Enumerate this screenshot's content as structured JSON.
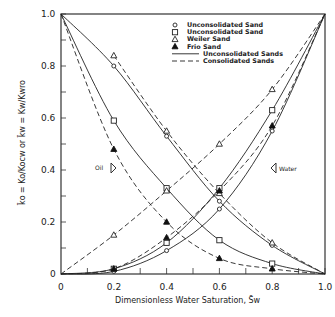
{
  "chart_data": {
    "type": "line",
    "title": "",
    "xlabel": "Dimensionless Water Saturation, S̄w",
    "ylabel": "k̄o = Ko/Kocw  or  k̄w = Kw/Kwro",
    "xlim": [
      0,
      1.0
    ],
    "ylim": [
      0,
      1.0
    ],
    "x_ticks": [
      "0",
      "0.2",
      "0.4",
      "0.6",
      "0.8",
      "1.0"
    ],
    "y_ticks": [
      "0",
      "0.2",
      "0.4",
      "0.6",
      "0.8",
      "1.0"
    ],
    "grid": false,
    "legend_position": "upper-right",
    "legend": [
      {
        "marker": "circle",
        "label": "Unconsolidated Sand"
      },
      {
        "marker": "square",
        "label": "Unconsolidated Sand"
      },
      {
        "marker": "triangle-open",
        "label": "Weiler Sand"
      },
      {
        "marker": "triangle-filled",
        "label": "Frio Sand"
      },
      {
        "line": "solid",
        "label": "Unconsolidated Sands"
      },
      {
        "line": "dashed",
        "label": "Consolidated Sands"
      }
    ],
    "annotations": [
      {
        "text": "Oil",
        "x": 0.19,
        "y": 0.41
      },
      {
        "text": "Water",
        "x": 0.84,
        "y": 0.41
      }
    ],
    "series": [
      {
        "name": "Oil - Unconsolidated Sand (circle)",
        "style": "solid",
        "marker": "circle",
        "x": [
          0,
          0.2,
          0.4,
          0.6,
          0.8,
          1.0
        ],
        "y": [
          1.0,
          0.8,
          0.53,
          0.28,
          0.11,
          0
        ]
      },
      {
        "name": "Oil - Unconsolidated Sand (square)",
        "style": "solid",
        "marker": "square",
        "x": [
          0,
          0.2,
          0.4,
          0.6,
          0.8,
          1.0
        ],
        "y": [
          1.0,
          0.59,
          0.33,
          0.13,
          0.04,
          0
        ]
      },
      {
        "name": "Oil - Weiler Sand",
        "style": "dashed",
        "marker": "triangle-open",
        "x": [
          0.2,
          0.4,
          0.6,
          0.8,
          1.0
        ],
        "y": [
          0.84,
          0.55,
          0.31,
          0.12,
          0
        ]
      },
      {
        "name": "Oil - Frio Sand",
        "style": "dashed",
        "marker": "triangle-filled",
        "x": [
          0,
          0.2,
          0.4,
          0.6,
          0.8,
          1.0
        ],
        "y": [
          1.0,
          0.48,
          0.2,
          0.06,
          0.02,
          0
        ]
      },
      {
        "name": "Water - Unconsolidated Sand (circle)",
        "style": "solid",
        "marker": "circle",
        "x": [
          0,
          0.2,
          0.4,
          0.6,
          0.8,
          1.0
        ],
        "y": [
          0,
          0.01,
          0.09,
          0.25,
          0.55,
          1.0
        ]
      },
      {
        "name": "Water - Unconsolidated Sand (square)",
        "style": "solid",
        "marker": "square",
        "x": [
          0,
          0.2,
          0.4,
          0.6,
          0.8,
          1.0
        ],
        "y": [
          0,
          0.02,
          0.12,
          0.33,
          0.63,
          1.0
        ]
      },
      {
        "name": "Water - Weiler Sand",
        "style": "dashed",
        "marker": "triangle-open",
        "x": [
          0,
          0.2,
          0.4,
          0.6,
          0.8,
          1.0
        ],
        "y": [
          0,
          0.15,
          0.32,
          0.5,
          0.71,
          1.0
        ]
      },
      {
        "name": "Water - Frio Sand",
        "style": "dashed",
        "marker": "triangle-filled",
        "x": [
          0,
          0.2,
          0.4,
          0.6,
          0.8,
          1.0
        ],
        "y": [
          0,
          0.02,
          0.14,
          0.32,
          0.57,
          1.0
        ]
      }
    ]
  },
  "labels": {
    "x_axis": "Dimensionless Water Saturation, S̄w",
    "oil_arrow": "Oil",
    "water_arrow": "Water"
  }
}
